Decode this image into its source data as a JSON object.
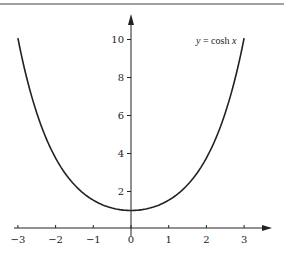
{
  "chart_data": {
    "type": "line",
    "title": "",
    "function": "cosh x",
    "annotation": "y = cosh x",
    "xlabel": "",
    "ylabel": "",
    "xlim": [
      -3,
      3
    ],
    "ylim": [
      0,
      10
    ],
    "x_ticks": [
      -3,
      -2,
      -1,
      0,
      1,
      2,
      3
    ],
    "x_tick_labels": [
      "−3",
      "−2",
      "−1",
      "0",
      "1",
      "2",
      "3"
    ],
    "y_ticks": [
      2,
      4,
      6,
      8,
      10
    ],
    "y_tick_labels": [
      "2",
      "4",
      "6",
      "8",
      "10"
    ],
    "grid": false,
    "legend": "none",
    "series": [
      {
        "name": "y = cosh x",
        "x": [
          -3,
          -2.5,
          -2,
          -1.5,
          -1,
          -0.5,
          0,
          0.5,
          1,
          1.5,
          2,
          2.5,
          3
        ],
        "y": [
          10.07,
          6.13,
          3.76,
          2.35,
          1.54,
          1.13,
          1.0,
          1.13,
          1.54,
          2.35,
          3.76,
          6.13,
          10.07
        ]
      }
    ]
  },
  "labels": {
    "curve": "y = cosh x",
    "curve_y": "y",
    "curve_eq": " = cosh ",
    "curve_x": "x"
  },
  "colors": {
    "ink": "#222222",
    "background": "#ffffff",
    "top_rule": "#444444"
  }
}
